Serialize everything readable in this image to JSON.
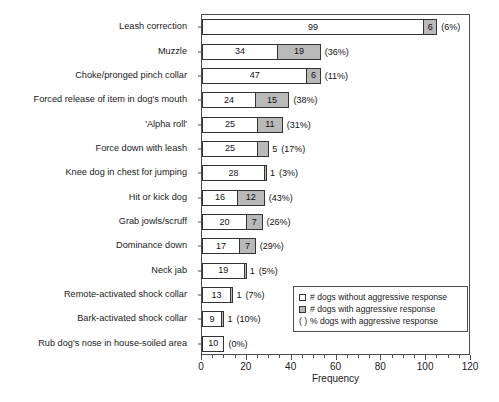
{
  "chart_data": {
    "type": "bar",
    "orientation": "horizontal",
    "stacked": true,
    "title": "",
    "xlabel": "Frequency",
    "ylabel": "",
    "xlim": [
      0,
      120
    ],
    "xticks": [
      0,
      20,
      40,
      60,
      80,
      100,
      120
    ],
    "xtick_labels": [
      "0",
      "20",
      "40",
      "60",
      "80",
      "100",
      "120"
    ],
    "grid": false,
    "legend_position": "bottom-right",
    "categories": [
      "Leash correction",
      "Muzzle",
      "Choke/pronged pinch collar",
      "Forced release of item in dog's mouth",
      "'Alpha roll'",
      "Force down with leash",
      "Knee dog in chest for jumping",
      "Hit or kick dog",
      "Grab jowls/scruff",
      "Dominance down",
      "Neck jab",
      "Remote-activated shock collar",
      "Bark-activated shock collar",
      "Rub dog's nose in house-soiled area"
    ],
    "series": [
      {
        "name": "# dogs without aggressive response",
        "values": [
          99,
          34,
          47,
          24,
          25,
          25,
          28,
          16,
          20,
          17,
          19,
          13,
          9,
          10
        ]
      },
      {
        "name": "# dogs with aggressive response",
        "values": [
          6,
          19,
          6,
          15,
          11,
          5,
          1,
          12,
          7,
          7,
          1,
          1,
          1,
          0
        ]
      }
    ],
    "percent_labels": [
      "(6%)",
      "(36%)",
      "(11%)",
      "(38%)",
      "(31%)",
      "(17%)",
      "(3%)",
      "(43%)",
      "(26%)",
      "(29%)",
      "(5%)",
      "(7%)",
      "(10%)",
      "(0%)"
    ]
  },
  "rows": [
    {
      "label": "Leash correction",
      "a": 99,
      "b": 6,
      "pct": "(6%)"
    },
    {
      "label": "Muzzle",
      "a": 34,
      "b": 19,
      "pct": "(36%)"
    },
    {
      "label": "Choke/pronged pinch collar",
      "a": 47,
      "b": 6,
      "pct": "(11%)"
    },
    {
      "label": "Forced release of item in dog's mouth",
      "a": 24,
      "b": 15,
      "pct": "(38%)"
    },
    {
      "label": "'Alpha roll'",
      "a": 25,
      "b": 11,
      "pct": "(31%)"
    },
    {
      "label": "Force down with leash",
      "a": 25,
      "b": 5,
      "pct": "(17%)"
    },
    {
      "label": "Knee dog in chest for jumping",
      "a": 28,
      "b": 1,
      "pct": "(3%)"
    },
    {
      "label": "Hit or kick dog",
      "a": 16,
      "b": 12,
      "pct": "(43%)"
    },
    {
      "label": "Grab jowls/scruff",
      "a": 20,
      "b": 7,
      "pct": "(26%)"
    },
    {
      "label": "Dominance down",
      "a": 17,
      "b": 7,
      "pct": "(29%)"
    },
    {
      "label": "Neck jab",
      "a": 19,
      "b": 1,
      "pct": "(5%)"
    },
    {
      "label": "Remote-activated shock collar",
      "a": 13,
      "b": 1,
      "pct": "(7%)"
    },
    {
      "label": "Bark-activated shock collar",
      "a": 9,
      "b": 1,
      "pct": "(10%)"
    },
    {
      "label": "Rub dog's nose in house-soiled area",
      "a": 10,
      "b": 0,
      "pct": "(0%)"
    }
  ],
  "axis": {
    "x_title": "Frequency",
    "x_ticks": [
      "0",
      "20",
      "40",
      "60",
      "80",
      "100",
      "120"
    ]
  },
  "legend": {
    "items": [
      {
        "marker": "white-square",
        "text": "# dogs without aggressive response"
      },
      {
        "marker": "gray-square",
        "text": "# dogs with aggressive response"
      },
      {
        "marker": "parentheses",
        "text": "% dogs with aggressive response"
      }
    ],
    "paren_glyph": "( )"
  },
  "colors": {
    "no_aggression_fill": "#ffffff",
    "aggression_fill": "#b9b9b9",
    "outline": "#333333",
    "axis": "#4d4d4d",
    "text": "#1a1a1a"
  }
}
